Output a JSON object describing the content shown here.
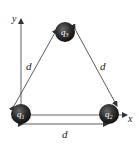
{
  "diagram": {
    "axes": {
      "x_label": "x",
      "y_label": "y"
    },
    "charges": [
      {
        "id": "q1",
        "label": "q",
        "subscript": "1",
        "position": "bottom-left"
      },
      {
        "id": "q2",
        "label": "q",
        "subscript": "2",
        "position": "bottom-right"
      },
      {
        "id": "q3",
        "label": "q",
        "subscript": "3",
        "position": "top"
      }
    ],
    "distances": {
      "left_side": "d",
      "right_side": "d",
      "bottom_side": "d"
    },
    "colors": {
      "charge_fill": "#2b2b2b",
      "line": "#333333",
      "axis": "#555555"
    }
  }
}
